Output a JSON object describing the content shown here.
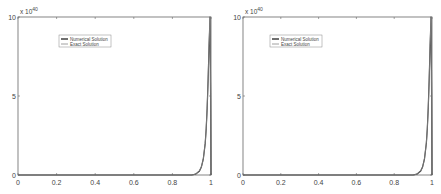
{
  "chart_data": [
    {
      "type": "line",
      "title": "",
      "xlabel": "",
      "ylabel": "",
      "xlim": [
        0,
        1
      ],
      "ylim": [
        0,
        10
      ],
      "y_exponent_label": "x 10",
      "y_exponent": "40",
      "xticks": [
        "0",
        "0.2",
        "0.4",
        "0.6",
        "0.8",
        "1"
      ],
      "yticks": [
        "0",
        "5",
        "10"
      ],
      "grid": false,
      "legend_position": "upper-left-inside",
      "series": [
        {
          "name": "Numerical Solution",
          "color": "#333333",
          "x": [
            0,
            0.9,
            0.92,
            0.94,
            0.95,
            0.96,
            0.97,
            0.975,
            0.98,
            0.985,
            0.99,
            0.995,
            0.998,
            1.0
          ],
          "y": [
            0,
            0,
            0.05,
            0.25,
            0.5,
            1.0,
            2.0,
            2.9,
            4.2,
            6.0,
            8.2,
            10.0,
            5.0,
            0
          ]
        },
        {
          "name": "Exact Solution",
          "color": "#888888",
          "x": [
            0,
            0.9,
            0.92,
            0.94,
            0.95,
            0.96,
            0.97,
            0.975,
            0.98,
            0.985,
            0.99,
            0.995,
            0.998,
            1.0
          ],
          "y": [
            0,
            0,
            0.05,
            0.25,
            0.5,
            1.0,
            2.0,
            2.9,
            4.2,
            6.0,
            8.2,
            10.0,
            5.0,
            0
          ]
        }
      ]
    },
    {
      "type": "line",
      "title": "",
      "xlabel": "",
      "ylabel": "",
      "xlim": [
        0,
        1
      ],
      "ylim": [
        0,
        10
      ],
      "y_exponent_label": "x 10",
      "y_exponent": "40",
      "xticks": [
        "0",
        "0.2",
        "0.4",
        "0.6",
        "0.8",
        "1"
      ],
      "yticks": [
        "0",
        "5",
        "10"
      ],
      "grid": false,
      "legend_position": "upper-left-inside",
      "series": [
        {
          "name": "Numerical Solution",
          "color": "#333333",
          "x": [
            0,
            0.9,
            0.92,
            0.94,
            0.95,
            0.96,
            0.97,
            0.975,
            0.98,
            0.985,
            0.99,
            0.995,
            0.998,
            1.0
          ],
          "y": [
            0,
            0,
            0.05,
            0.25,
            0.5,
            1.0,
            2.0,
            2.9,
            4.2,
            6.0,
            8.2,
            10.0,
            5.0,
            0
          ]
        },
        {
          "name": "Exact Solution",
          "color": "#888888",
          "x": [
            0,
            0.9,
            0.92,
            0.94,
            0.95,
            0.96,
            0.97,
            0.975,
            0.98,
            0.985,
            0.99,
            0.995,
            0.998,
            1.0
          ],
          "y": [
            0,
            0,
            0.05,
            0.25,
            0.5,
            1.0,
            2.0,
            2.9,
            4.2,
            6.0,
            8.2,
            10.0,
            5.0,
            0
          ]
        }
      ]
    }
  ],
  "panels": [
    {
      "legend": [
        "Numerical Solution",
        "Exact Solution"
      ]
    },
    {
      "legend": [
        "Numerical Solution",
        "Exact Solution"
      ]
    }
  ]
}
